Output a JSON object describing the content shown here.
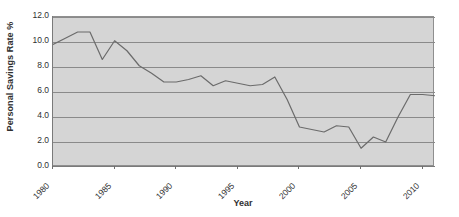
{
  "chart_data": {
    "type": "line",
    "title": "",
    "xlabel": "Year",
    "ylabel": "Personal Savings Rate %",
    "xlim": [
      1980,
      2011
    ],
    "ylim": [
      0.0,
      12.0
    ],
    "grid": true,
    "legend": "none",
    "line_color": "#6b6b6b",
    "plot_background": "#d5d5d5",
    "gridline_color": "#8a8a8a",
    "y_ticks": [
      "0.0",
      "2.0",
      "4.0",
      "6.0",
      "8.0",
      "10.0",
      "12.0"
    ],
    "y_tick_values": [
      0.0,
      2.0,
      4.0,
      6.0,
      8.0,
      10.0,
      12.0
    ],
    "x_ticks": [
      "1980",
      "1985",
      "1990",
      "1995",
      "2000",
      "2005",
      "2010"
    ],
    "x_tick_values": [
      1980,
      1985,
      1990,
      1995,
      2000,
      2005,
      2010
    ],
    "x": [
      1980,
      1981,
      1982,
      1983,
      1984,
      1985,
      1986,
      1987,
      1988,
      1989,
      1990,
      1991,
      1992,
      1993,
      1994,
      1995,
      1996,
      1997,
      1998,
      1999,
      2000,
      2001,
      2002,
      2003,
      2004,
      2005,
      2006,
      2007,
      2008,
      2009,
      2010,
      2011
    ],
    "values": [
      9.8,
      10.3,
      10.8,
      10.8,
      8.6,
      10.1,
      9.3,
      8.1,
      7.5,
      6.8,
      6.8,
      7.0,
      7.3,
      6.5,
      6.9,
      6.7,
      6.5,
      6.6,
      7.2,
      5.4,
      3.2,
      3.0,
      2.8,
      3.3,
      3.2,
      1.5,
      2.4,
      2.0,
      4.0,
      5.8,
      5.8,
      5.7
    ]
  },
  "axes": {
    "y_title": "Personal Savings Rate %",
    "x_title": "Year"
  }
}
